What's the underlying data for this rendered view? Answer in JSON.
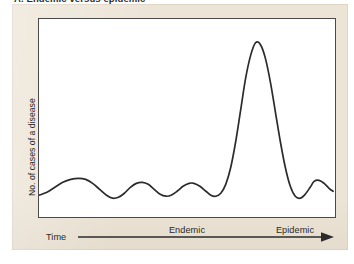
{
  "figure": {
    "title": "A. Endemic versus epidemic",
    "panel_color": "#ece4d6",
    "plot_background": "#ffffff",
    "frame_color": "#4a4a4a",
    "curve_color": "#2b2b2b"
  },
  "axes": {
    "y_label": "No. of cases of a disease",
    "x_label": "Time",
    "x_arrow_direction": "right"
  },
  "regions": [
    {
      "id": "endemic",
      "label": "Endemic"
    },
    {
      "id": "epidemic",
      "label": "Epidemic"
    }
  ],
  "chart_data": {
    "type": "line",
    "title": "A. Endemic versus epidemic",
    "xlabel": "Time",
    "ylabel": "No. of cases of a disease",
    "xlim": [
      0,
      298
    ],
    "ylim": [
      0,
      200
    ],
    "grid": false,
    "legend": null,
    "axis_ticks": {
      "x": [],
      "y": []
    },
    "annotations": [
      {
        "text": "Endemic",
        "x": 110,
        "y": 188,
        "note": "low-level continuous baseline oscillation"
      },
      {
        "text": "Epidemic",
        "x": 218,
        "y": 188,
        "note": "sharp large-magnitude outbreak peak"
      }
    ],
    "series": [
      {
        "name": "No. of cases of a disease over time",
        "description": "Endemic baseline of small regular fluctuations followed by a single tall narrow epidemic spike, then a return toward baseline fluctuation.",
        "points": [
          [
            0,
            22
          ],
          [
            8,
            25
          ],
          [
            16,
            30
          ],
          [
            24,
            35
          ],
          [
            32,
            38
          ],
          [
            40,
            39
          ],
          [
            47,
            38
          ],
          [
            54,
            34
          ],
          [
            61,
            28
          ],
          [
            68,
            22
          ],
          [
            74,
            19
          ],
          [
            80,
            20
          ],
          [
            86,
            24
          ],
          [
            92,
            30
          ],
          [
            98,
            34
          ],
          [
            104,
            35
          ],
          [
            110,
            33
          ],
          [
            116,
            28
          ],
          [
            122,
            23
          ],
          [
            128,
            21
          ],
          [
            133,
            22
          ],
          [
            139,
            26
          ],
          [
            145,
            31
          ],
          [
            151,
            34
          ],
          [
            156,
            34
          ],
          [
            162,
            31
          ],
          [
            168,
            26
          ],
          [
            173,
            22
          ],
          [
            178,
            21
          ],
          [
            183,
            24
          ],
          [
            188,
            33
          ],
          [
            193,
            50
          ],
          [
            198,
            76
          ],
          [
            203,
            108
          ],
          [
            208,
            140
          ],
          [
            213,
            163
          ],
          [
            218,
            176
          ],
          [
            223,
            174
          ],
          [
            228,
            160
          ],
          [
            233,
            136
          ],
          [
            238,
            106
          ],
          [
            243,
            76
          ],
          [
            248,
            50
          ],
          [
            253,
            31
          ],
          [
            258,
            21
          ],
          [
            263,
            19
          ],
          [
            268,
            23
          ],
          [
            273,
            30
          ],
          [
            277,
            36
          ],
          [
            282,
            37
          ],
          [
            287,
            34
          ],
          [
            292,
            29
          ],
          [
            296,
            26
          ]
        ],
        "peak": {
          "x": 218,
          "y": 176,
          "label": "epidemic peak"
        },
        "baseline_range": [
          19,
          39
        ]
      }
    ]
  }
}
